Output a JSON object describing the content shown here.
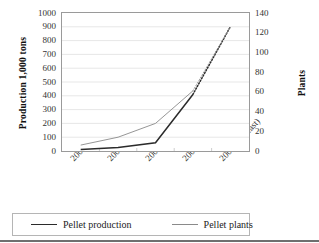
{
  "chart_data": {
    "type": "line",
    "title": "",
    "categories": [
      "2003",
      "2004",
      "2005",
      "2006 (estimated)",
      "2007 (forecast)"
    ],
    "series": [
      {
        "name": "Pellet production",
        "axis": "left",
        "color": "#2b2b2b",
        "values": [
          10,
          25,
          60,
          410,
          900
        ],
        "dashed_from_index": 3
      },
      {
        "name": "Pellet plants",
        "axis": "right",
        "color": "#8a8a8a",
        "values": [
          6,
          14,
          28,
          61,
          126
        ],
        "dashed_from_index": 3
      }
    ],
    "ylabel": "Production 1,000 tons",
    "ylim": [
      0,
      1000
    ],
    "yticks": [
      0,
      100,
      200,
      300,
      400,
      500,
      600,
      700,
      800,
      900,
      1000
    ],
    "y2label": "Plants",
    "y2lim": [
      0,
      140
    ],
    "y2ticks": [
      0,
      20,
      40,
      60,
      80,
      100,
      120,
      140
    ],
    "xlabel": "",
    "grid": true,
    "legend_position": "bottom"
  },
  "axes": {
    "left_title": "Production 1,000 tons",
    "right_title": "Plants",
    "left_ticks": [
      "1000",
      "900",
      "800",
      "700",
      "600",
      "500",
      "400",
      "300",
      "200",
      "100",
      "0"
    ],
    "right_ticks": [
      "140",
      "120",
      "100",
      "80",
      "60",
      "40",
      "20",
      "0"
    ],
    "x_ticks": [
      "2003",
      "2004",
      "2005",
      "2006 (estimated)",
      "2007 (forecast)"
    ]
  },
  "legend": {
    "items": [
      {
        "label": "Pellet production",
        "color": "#2b2b2b"
      },
      {
        "label": "Pellet plants",
        "color": "#8a8a8a"
      }
    ]
  }
}
